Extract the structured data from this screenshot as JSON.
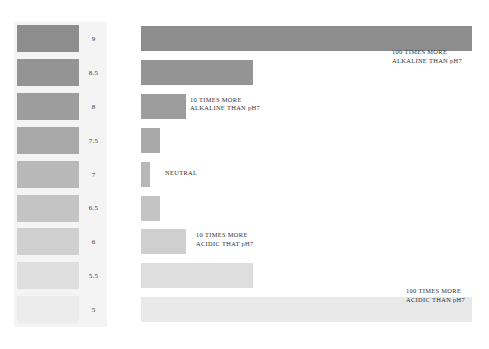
{
  "figure": {
    "name": "ph-scale-bar-chart",
    "background_color": "#ffffff"
  },
  "swatch_panel": {
    "name": "ph-color-swatch-column",
    "background_color": "#f4f4f4"
  },
  "chart_data": {
    "type": "bar",
    "orientation": "horizontal",
    "title": "",
    "subtitle": "",
    "xlabel": "",
    "ylabel": "pH",
    "grid": false,
    "legend": null,
    "categories": [
      "9",
      "8.5",
      "8",
      "7.5",
      "7",
      "6.5",
      "6",
      "5.5",
      "5"
    ],
    "values": [
      100,
      31.6,
      10,
      3.16,
      1,
      3.16,
      10,
      31.6,
      100
    ],
    "bar_pixel_lengths": [
      331,
      112,
      45,
      19,
      9,
      19,
      45,
      112,
      331
    ],
    "bar_colors": [
      "#8d8d8d",
      "#949494",
      "#9d9d9d",
      "#a8a8a8",
      "#b8b8b8",
      "#c4c4c4",
      "#cfcfcf",
      "#dedede",
      "#e9e9e9"
    ],
    "swatch_colors": [
      "#8d8d8d",
      "#949494",
      "#9d9d9d",
      "#a8a8a8",
      "#b8b8b8",
      "#c4c4c4",
      "#cfcfcf",
      "#dedede",
      "#ececec"
    ],
    "annotations": [
      {
        "category": "9",
        "line1": "100 TIMES MORE",
        "line2": "ALKALINE THAN pH7"
      },
      {
        "category": "8",
        "line1": "10 TIMES MORE",
        "line2": "ALKALINE THAN pH7"
      },
      {
        "category": "7",
        "line1": "NEUTRAL",
        "line2": ""
      },
      {
        "category": "6",
        "line1": "10 TIMES MORE",
        "line2": "ACIDIC THAT pH7"
      },
      {
        "category": "5",
        "line1": "100 TIMES MORE",
        "line2": "ACIDIC THAN pH7"
      }
    ]
  },
  "rows": [
    {
      "ph": "9",
      "swatch_color": "#8d8d8d",
      "bar_color": "#8d8d8d",
      "bar_width": 331,
      "note_line1": "100 TIMES MORE",
      "note_line2": "ALKALINE THAN pH7",
      "note_left": 392,
      "note_top": 26
    },
    {
      "ph": "8.5",
      "swatch_color": "#949494",
      "bar_color": "#949494",
      "bar_width": 112,
      "note_line1": "",
      "note_line2": "",
      "note_left": 0,
      "note_top": 0
    },
    {
      "ph": "8",
      "swatch_color": "#9d9d9d",
      "bar_color": "#9d9d9d",
      "bar_width": 45,
      "note_line1": "10 TIMES MORE",
      "note_line2": "ALKALINE THAN pH7",
      "note_left": 190,
      "note_top": 6
    },
    {
      "ph": "7.5",
      "swatch_color": "#a8a8a8",
      "bar_color": "#a8a8a8",
      "bar_width": 19,
      "note_line1": "",
      "note_line2": "",
      "note_left": 0,
      "note_top": 0
    },
    {
      "ph": "7",
      "swatch_color": "#b8b8b8",
      "bar_color": "#b8b8b8",
      "bar_width": 9,
      "note_line1": "NEUTRAL",
      "note_line2": "",
      "note_left": 165,
      "note_top": 11
    },
    {
      "ph": "6.5",
      "swatch_color": "#c4c4c4",
      "bar_color": "#c4c4c4",
      "bar_width": 19,
      "note_line1": "",
      "note_line2": "",
      "note_left": 0,
      "note_top": 0
    },
    {
      "ph": "6",
      "swatch_color": "#cfcfcf",
      "bar_color": "#cfcfcf",
      "bar_width": 45,
      "note_line1": "10 TIMES MORE",
      "note_line2": "ACIDIC THAT pH7",
      "note_left": 196,
      "note_top": 6
    },
    {
      "ph": "5.5",
      "swatch_color": "#dedede",
      "bar_color": "#dedede",
      "bar_width": 112,
      "note_line1": "",
      "note_line2": "",
      "note_left": 0,
      "note_top": 0
    },
    {
      "ph": "5",
      "swatch_color": "#ececec",
      "bar_color": "#e9e9e9",
      "bar_width": 331,
      "note_line1": "100 TIMES MORE",
      "note_line2": "ACIDIC THAN pH7",
      "note_left": 406,
      "note_top": -6
    }
  ]
}
